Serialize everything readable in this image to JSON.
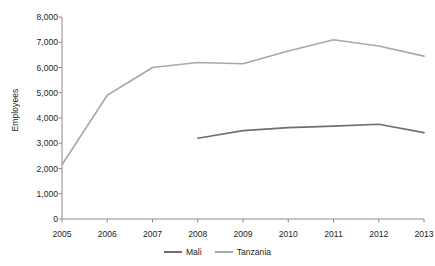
{
  "chart_data": {
    "type": "line",
    "title": "",
    "subtitle": "",
    "xlabel": "",
    "ylabel": "Employees",
    "categories": [
      "2005",
      "2006",
      "2007",
      "2008",
      "2009",
      "2010",
      "2011",
      "2012",
      "2013"
    ],
    "x": [
      2005,
      2006,
      2007,
      2008,
      2009,
      2010,
      2011,
      2012,
      2013
    ],
    "series": [
      {
        "name": "Mali",
        "color": "#6f6f6f",
        "values": [
          null,
          null,
          null,
          3200,
          3500,
          3620,
          3680,
          3750,
          3420
        ]
      },
      {
        "name": "Tanzania",
        "color": "#a8a8a8",
        "values": [
          2150,
          4900,
          6000,
          6200,
          6150,
          6650,
          7100,
          6850,
          6450
        ]
      }
    ],
    "ylim": [
      0,
      8000
    ],
    "ytick_values": [
      0,
      1000,
      2000,
      3000,
      4000,
      5000,
      6000,
      7000,
      8000
    ],
    "ytick_labels": [
      "0",
      "1,000",
      "2,000",
      "3,000",
      "4,000",
      "5,000",
      "6,000",
      "7,000",
      "8,000"
    ],
    "xlim": [
      2005,
      2013
    ],
    "grid": false,
    "legend_position": "bottom-center",
    "annotations": []
  },
  "legend": {
    "entries": [
      {
        "label": "Mali",
        "color": "#6f6f6f"
      },
      {
        "label": "Tanzania",
        "color": "#a8a8a8"
      }
    ]
  },
  "axes": {
    "y_title": "Employees",
    "axis_color": "#8c8c8c"
  }
}
